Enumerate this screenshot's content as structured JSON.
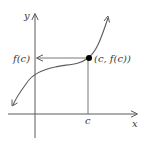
{
  "diagram": {
    "type": "function-graph",
    "labels": {
      "x_axis": "x",
      "y_axis": "y",
      "point": "(c, f(c))",
      "y_value": "f(c)",
      "x_value": "c"
    },
    "colors": {
      "axis": "#5a5a5a",
      "curve": "#5a5a5a",
      "guide": "#6a6a6a",
      "point": "#000000",
      "text": "#3a3a3a"
    }
  }
}
